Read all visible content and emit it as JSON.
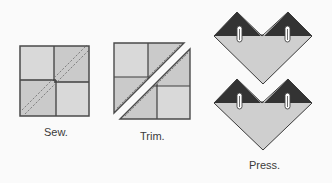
{
  "steps": [
    {
      "id": "sew",
      "label": "Sew.",
      "description": "Four-patch square with two dashed stitching lines along the diagonal"
    },
    {
      "id": "trim",
      "label": "Trim.",
      "description": "Square cut along the diagonal between stitching lines into two triangles"
    },
    {
      "id": "press",
      "label": "Press.",
      "description": "Two pressed units, each a light triangle with two dark triangle points on top, with pins"
    }
  ],
  "colors": {
    "background": "#fafafa",
    "patch_light": "#d8d8d8",
    "patch_mid": "#cbcbcb",
    "outline": "#4a4a4a",
    "stitch": "#7a7a7a",
    "dark_fabric": "#333333",
    "light_fabric": "#cfcfcf",
    "pin": "#ffffff",
    "label_text": "#3a3a3a"
  },
  "icons": {
    "pin": "safety-pin-icon"
  }
}
